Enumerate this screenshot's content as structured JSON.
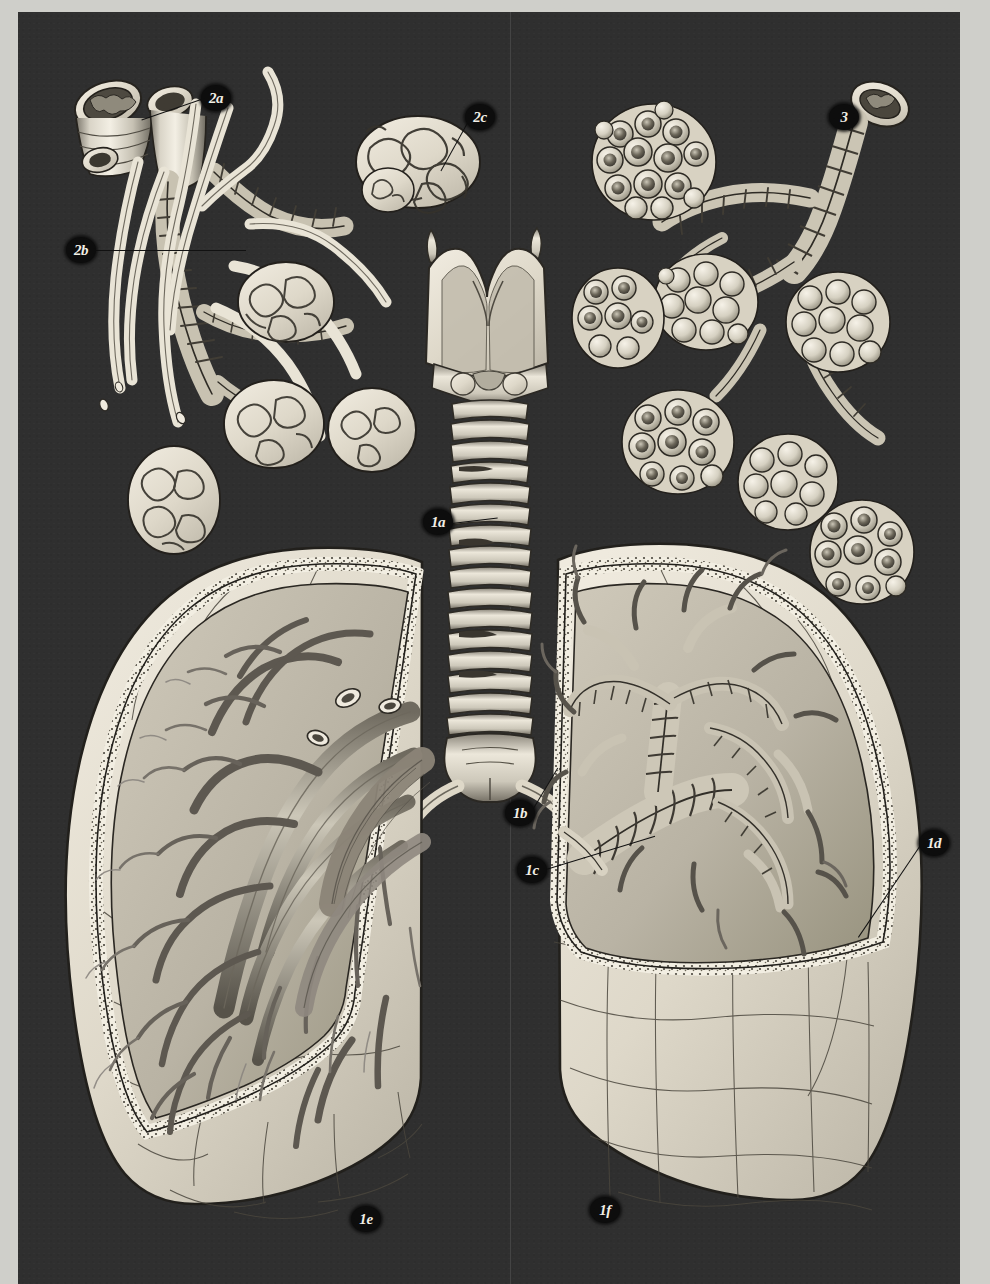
{
  "plate": {
    "title": "Respiratory System — Trachea, Bronchi, Lungs and Alveoli",
    "background_color": "#2f2f2f",
    "paper_color": "#cfcfca",
    "ink_light": "#efeade",
    "ink_mid": "#b5b0a4",
    "ink_dark": "#3a3a3a"
  },
  "labels": [
    {
      "id": "2a",
      "text": "2a",
      "x": 183,
      "y": 73,
      "leader": {
        "len": 64,
        "angle": 160
      }
    },
    {
      "id": "2c",
      "text": "2c",
      "x": 447,
      "y": 92,
      "leader": {
        "len": 58,
        "angle": 118
      }
    },
    {
      "id": "3",
      "text": "3",
      "x": 811,
      "y": 92,
      "leader": {
        "len": 0,
        "angle": 0
      }
    },
    {
      "id": "2b",
      "text": "2b",
      "x": 48,
      "y": 225,
      "leader": {
        "len": 148,
        "angle": 2
      }
    },
    {
      "id": "1a",
      "text": "1a",
      "x": 405,
      "y": 497,
      "leader": {
        "len": 46,
        "angle": -7
      }
    },
    {
      "id": "1b",
      "text": "1b",
      "x": 487,
      "y": 788,
      "leader": {
        "len": 50,
        "angle": -58
      }
    },
    {
      "id": "1c",
      "text": "1c",
      "x": 499,
      "y": 845,
      "leader": {
        "len": 112,
        "angle": -16
      }
    },
    {
      "id": "1d",
      "text": "1d",
      "x": 901,
      "y": 818,
      "leader": {
        "len": 108,
        "angle": 123
      }
    },
    {
      "id": "1e",
      "text": "1e",
      "x": 333,
      "y": 1194,
      "leader": {
        "len": 0,
        "angle": 0
      }
    },
    {
      "id": "1f",
      "text": "1f",
      "x": 572,
      "y": 1185,
      "leader": {
        "len": 0,
        "angle": 0
      }
    }
  ],
  "figures": {
    "larynx_trachea": {
      "name": "larynx-and-trachea",
      "label": "1a",
      "rings": 19
    },
    "carina": {
      "name": "tracheal-bifurcation",
      "label": "1b"
    },
    "hilum": {
      "name": "lung-hilum-root",
      "label": "1c"
    },
    "right_lung": {
      "name": "right-lung-bronchial-section",
      "labels": [
        "1d",
        "1f"
      ],
      "contents": "bronchial tree with cartilage rings"
    },
    "left_lung": {
      "name": "left-lung-vascular-section",
      "labels": [
        "1e"
      ],
      "contents": "pulmonary vascular tree"
    },
    "bronchiole_vascular_detail": {
      "name": "bronchiole-with-capillary-network",
      "labels": [
        "2a",
        "2b",
        "2c"
      ]
    },
    "alveolar_detail": {
      "name": "alveolar-sacs-detail",
      "labels": [
        "3"
      ]
    }
  }
}
